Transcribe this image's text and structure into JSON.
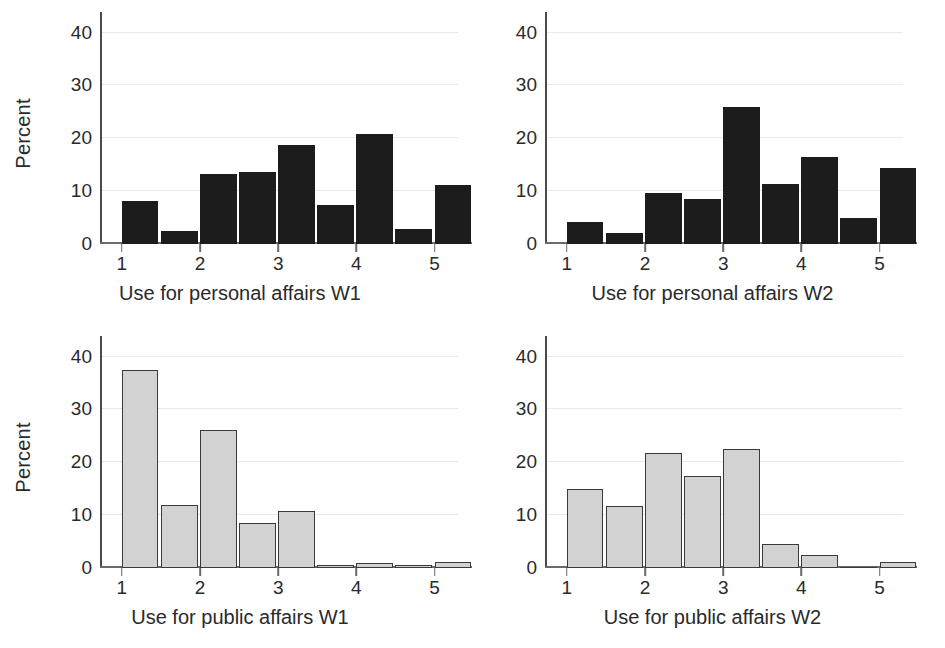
{
  "figure": {
    "width": 945,
    "height": 648,
    "ylabel": "Percent",
    "yticks": [
      0,
      10,
      20,
      30,
      40
    ],
    "xticks": [
      1,
      2,
      3,
      4,
      5
    ],
    "ylim": [
      0,
      42
    ],
    "xlim": [
      0.72,
      5.3
    ],
    "bar_positions": [
      1,
      1.5,
      2,
      2.5,
      3,
      3.5,
      4,
      4.5,
      5
    ],
    "colors": {
      "dark_fill": "#1c1c1c",
      "light_fill": "#d2d2d2",
      "light_edge": "#3a3a3a",
      "grid": "#e9e9e9",
      "axis": "#4a4a4a",
      "text": "#2a2a2a",
      "background": "#ffffff"
    }
  },
  "chart_data": [
    {
      "type": "bar",
      "panel": "top-left",
      "title": "",
      "xlabel": "Use for personal affairs W1",
      "ylabel": "Percent",
      "xlim": [
        0.72,
        5.3
      ],
      "ylim": [
        0,
        42
      ],
      "grid": true,
      "legend": "none",
      "style": "dark",
      "categories": [
        "1",
        "1.5",
        "2",
        "2.5",
        "3",
        "3.5",
        "4",
        "4.5",
        "5"
      ],
      "x": [
        1,
        1.5,
        2,
        2.5,
        3,
        3.5,
        4,
        4.5,
        5
      ],
      "values": [
        8.1,
        2.4,
        13.2,
        13.7,
        18.7,
        7.4,
        20.8,
        2.9,
        11.1
      ],
      "xtick_labels": [
        "1",
        "2",
        "3",
        "4",
        "5"
      ],
      "ytick_labels": [
        "0",
        "10",
        "20",
        "30",
        "40"
      ]
    },
    {
      "type": "bar",
      "panel": "top-right",
      "title": "",
      "xlabel": "Use for personal affairs W2",
      "ylabel": "",
      "xlim": [
        0.72,
        5.3
      ],
      "ylim": [
        0,
        42
      ],
      "grid": true,
      "legend": "none",
      "style": "dark",
      "categories": [
        "1",
        "1.5",
        "2",
        "2.5",
        "3",
        "3.5",
        "4",
        "4.5",
        "5"
      ],
      "x": [
        1,
        1.5,
        2,
        2.5,
        3,
        3.5,
        4,
        4.5,
        5
      ],
      "values": [
        4.2,
        2.1,
        9.6,
        8.6,
        26.0,
        11.4,
        16.4,
        4.9,
        14.3
      ],
      "xtick_labels": [
        "1",
        "2",
        "3",
        "4",
        "5"
      ],
      "ytick_labels": [
        "0",
        "10",
        "20",
        "30",
        "40"
      ]
    },
    {
      "type": "bar",
      "panel": "bottom-left",
      "title": "",
      "xlabel": "Use for public affairs W1",
      "ylabel": "Percent",
      "xlim": [
        0.72,
        5.3
      ],
      "ylim": [
        0,
        42
      ],
      "grid": true,
      "legend": "none",
      "style": "light",
      "categories": [
        "1",
        "1.5",
        "2",
        "2.5",
        "3",
        "3.5",
        "4",
        "4.5",
        "5"
      ],
      "x": [
        1,
        1.5,
        2,
        2.5,
        3,
        3.5,
        4,
        4.5,
        5
      ],
      "values": [
        37.5,
        12.0,
        26.2,
        8.5,
        10.8,
        0.6,
        0.9,
        0.3,
        1.1
      ],
      "xtick_labels": [
        "1",
        "2",
        "3",
        "4",
        "5"
      ],
      "ytick_labels": [
        "0",
        "10",
        "20",
        "30",
        "40"
      ]
    },
    {
      "type": "bar",
      "panel": "bottom-right",
      "title": "",
      "xlabel": "Use for public affairs W2",
      "ylabel": "",
      "xlim": [
        0.72,
        5.3
      ],
      "ylim": [
        0,
        42
      ],
      "grid": true,
      "legend": "none",
      "style": "light",
      "categories": [
        "1",
        "1.5",
        "2",
        "2.5",
        "3",
        "3.5",
        "4",
        "4.5",
        "5"
      ],
      "x": [
        1,
        1.5,
        2,
        2.5,
        3,
        3.5,
        4,
        4.5,
        5
      ],
      "values": [
        15.0,
        11.8,
        21.7,
        17.5,
        22.6,
        4.6,
        2.5,
        0.0,
        1.2
      ],
      "xtick_labels": [
        "1",
        "2",
        "3",
        "4",
        "5"
      ],
      "ytick_labels": [
        "0",
        "10",
        "20",
        "30",
        "40"
      ]
    }
  ]
}
